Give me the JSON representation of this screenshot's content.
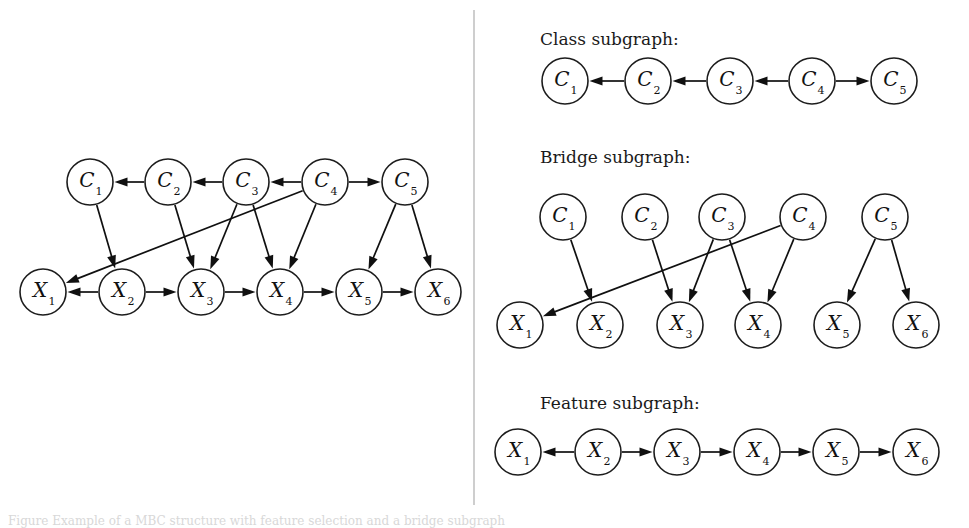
{
  "figure": {
    "background_color": "#ffffff",
    "ink_color": "#101010",
    "node_fill": "#ffffff",
    "divider_color": "#b9b9b9",
    "caption_partial": "Figure    Example of a MBC structure with feature selection and a bridge subgraph"
  },
  "panels": {
    "left": {
      "title": "",
      "class_nodes": [
        {
          "id": "C1",
          "base": "C",
          "sub": "1",
          "cx": 90,
          "cy": 182,
          "r": 23
        },
        {
          "id": "C2",
          "base": "C",
          "sub": "2",
          "cx": 168,
          "cy": 182,
          "r": 23
        },
        {
          "id": "C3",
          "base": "C",
          "sub": "3",
          "cx": 246,
          "cy": 182,
          "r": 23
        },
        {
          "id": "C4",
          "base": "C",
          "sub": "4",
          "cx": 325,
          "cy": 182,
          "r": 23
        },
        {
          "id": "C5",
          "base": "C",
          "sub": "5",
          "cx": 405,
          "cy": 182,
          "r": 23
        }
      ],
      "feature_nodes": [
        {
          "id": "X1",
          "base": "X",
          "sub": "1",
          "cx": 43,
          "cy": 292,
          "r": 23
        },
        {
          "id": "X2",
          "base": "X",
          "sub": "2",
          "cx": 122,
          "cy": 292,
          "r": 23
        },
        {
          "id": "X3",
          "base": "X",
          "sub": "3",
          "cx": 201,
          "cy": 292,
          "r": 23
        },
        {
          "id": "X4",
          "base": "X",
          "sub": "4",
          "cx": 280,
          "cy": 292,
          "r": 23
        },
        {
          "id": "X5",
          "base": "X",
          "sub": "5",
          "cx": 359,
          "cy": 292,
          "r": 23
        },
        {
          "id": "X6",
          "base": "X",
          "sub": "6",
          "cx": 438,
          "cy": 292,
          "r": 23
        }
      ],
      "edges": [
        {
          "from": "C2",
          "to": "C1",
          "kind": "class"
        },
        {
          "from": "C3",
          "to": "C2",
          "kind": "class"
        },
        {
          "from": "C4",
          "to": "C3",
          "kind": "class"
        },
        {
          "from": "C4",
          "to": "C5",
          "kind": "class"
        },
        {
          "from": "C1",
          "to": "X2",
          "kind": "bridge"
        },
        {
          "from": "C2",
          "to": "X3",
          "kind": "bridge"
        },
        {
          "from": "C3",
          "to": "X3",
          "kind": "bridge"
        },
        {
          "from": "C3",
          "to": "X4",
          "kind": "bridge"
        },
        {
          "from": "C4",
          "to": "X1",
          "kind": "bridge"
        },
        {
          "from": "C4",
          "to": "X4",
          "kind": "bridge"
        },
        {
          "from": "C5",
          "to": "X5",
          "kind": "bridge"
        },
        {
          "from": "C5",
          "to": "X6",
          "kind": "bridge"
        },
        {
          "from": "X2",
          "to": "X1",
          "kind": "feature"
        },
        {
          "from": "X2",
          "to": "X3",
          "kind": "feature"
        },
        {
          "from": "X3",
          "to": "X4",
          "kind": "feature"
        },
        {
          "from": "X4",
          "to": "X5",
          "kind": "feature"
        },
        {
          "from": "X5",
          "to": "X6",
          "kind": "feature"
        }
      ]
    },
    "class_subgraph": {
      "title": "Class subgraph:",
      "title_x": 540,
      "title_y": 45,
      "nodes": [
        {
          "id": "C1",
          "base": "C",
          "sub": "1",
          "cx": 565,
          "cy": 81,
          "r": 23
        },
        {
          "id": "C2",
          "base": "C",
          "sub": "2",
          "cx": 648,
          "cy": 81,
          "r": 23
        },
        {
          "id": "C3",
          "base": "C",
          "sub": "3",
          "cx": 730,
          "cy": 81,
          "r": 23
        },
        {
          "id": "C4",
          "base": "C",
          "sub": "4",
          "cx": 812,
          "cy": 81,
          "r": 23
        },
        {
          "id": "C5",
          "base": "C",
          "sub": "5",
          "cx": 894,
          "cy": 81,
          "r": 23
        }
      ],
      "edges": [
        {
          "from": "C2",
          "to": "C1"
        },
        {
          "from": "C3",
          "to": "C2"
        },
        {
          "from": "C4",
          "to": "C3"
        },
        {
          "from": "C4",
          "to": "C5"
        }
      ]
    },
    "bridge_subgraph": {
      "title": "Bridge subgraph:",
      "title_x": 540,
      "title_y": 163,
      "class_nodes": [
        {
          "id": "C1",
          "base": "C",
          "sub": "1",
          "cx": 563,
          "cy": 217,
          "r": 23
        },
        {
          "id": "C2",
          "base": "C",
          "sub": "2",
          "cx": 645,
          "cy": 217,
          "r": 23
        },
        {
          "id": "C3",
          "base": "C",
          "sub": "3",
          "cx": 722,
          "cy": 217,
          "r": 23
        },
        {
          "id": "C4",
          "base": "C",
          "sub": "4",
          "cx": 803,
          "cy": 217,
          "r": 23
        },
        {
          "id": "C5",
          "base": "C",
          "sub": "5",
          "cx": 885,
          "cy": 217,
          "r": 23
        }
      ],
      "feature_nodes": [
        {
          "id": "X1",
          "base": "X",
          "sub": "1",
          "cx": 520,
          "cy": 325,
          "r": 23
        },
        {
          "id": "X2",
          "base": "X",
          "sub": "2",
          "cx": 600,
          "cy": 325,
          "r": 23
        },
        {
          "id": "X3",
          "base": "X",
          "sub": "3",
          "cx": 680,
          "cy": 325,
          "r": 23
        },
        {
          "id": "X4",
          "base": "X",
          "sub": "4",
          "cx": 758,
          "cy": 325,
          "r": 23
        },
        {
          "id": "X5",
          "base": "X",
          "sub": "5",
          "cx": 837,
          "cy": 325,
          "r": 23
        },
        {
          "id": "X6",
          "base": "X",
          "sub": "6",
          "cx": 916,
          "cy": 325,
          "r": 23
        }
      ],
      "edges": [
        {
          "from": "C1",
          "to": "X2"
        },
        {
          "from": "C2",
          "to": "X3"
        },
        {
          "from": "C3",
          "to": "X3"
        },
        {
          "from": "C3",
          "to": "X4"
        },
        {
          "from": "C4",
          "to": "X1"
        },
        {
          "from": "C4",
          "to": "X4"
        },
        {
          "from": "C5",
          "to": "X5"
        },
        {
          "from": "C5",
          "to": "X6"
        }
      ]
    },
    "feature_subgraph": {
      "title": "Feature subgraph:",
      "title_x": 540,
      "title_y": 409,
      "nodes": [
        {
          "id": "X1",
          "base": "X",
          "sub": "1",
          "cx": 518,
          "cy": 452,
          "r": 23
        },
        {
          "id": "X2",
          "base": "X",
          "sub": "2",
          "cx": 598,
          "cy": 452,
          "r": 23
        },
        {
          "id": "X3",
          "base": "X",
          "sub": "3",
          "cx": 677,
          "cy": 452,
          "r": 23
        },
        {
          "id": "X4",
          "base": "X",
          "sub": "4",
          "cx": 757,
          "cy": 452,
          "r": 23
        },
        {
          "id": "X5",
          "base": "X",
          "sub": "5",
          "cx": 836,
          "cy": 452,
          "r": 23
        },
        {
          "id": "X6",
          "base": "X",
          "sub": "6",
          "cx": 916,
          "cy": 452,
          "r": 23
        }
      ],
      "edges": [
        {
          "from": "X2",
          "to": "X1"
        },
        {
          "from": "X2",
          "to": "X3"
        },
        {
          "from": "X3",
          "to": "X4"
        },
        {
          "from": "X4",
          "to": "X5"
        },
        {
          "from": "X5",
          "to": "X6"
        }
      ]
    }
  },
  "divider": {
    "x": 474,
    "y1": 10,
    "y2": 505
  }
}
